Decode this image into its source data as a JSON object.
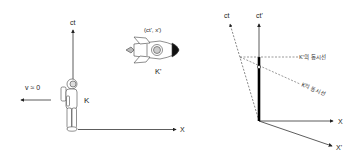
{
  "left_diagram": {
    "axes": {
      "ct_label": "ct",
      "x_label": "X"
    },
    "observer": {
      "icon": "astronaut-icon",
      "frame_label": "K"
    },
    "velocity": {
      "label": "v ≈ 0",
      "arrow_direction": "left"
    },
    "rocket": {
      "icon": "rocket-icon",
      "coords_label": "(ct', x')",
      "frame_label": "K'"
    }
  },
  "right_diagram": {
    "axes": {
      "ct_label": "ct",
      "ct_prime_label": "ct'",
      "x_label": "X",
      "x_prime_label": "X'"
    },
    "simultaneity_lines": {
      "k_prime": "K'의 동시선",
      "k": "K의 동시선"
    }
  },
  "colors": {
    "line": "#333333",
    "dashed": "#555555",
    "worldline": "#000000",
    "background": "#ffffff"
  }
}
